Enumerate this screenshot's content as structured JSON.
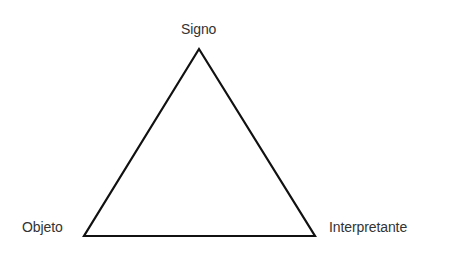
{
  "diagram": {
    "vertices": {
      "top": {
        "label": "Signo"
      },
      "bottom_left": {
        "label": "Objeto"
      },
      "bottom_right": {
        "label": "Interpretante"
      }
    },
    "colors": {
      "line": "#111111",
      "text": "#333333",
      "background": "#ffffff"
    }
  }
}
